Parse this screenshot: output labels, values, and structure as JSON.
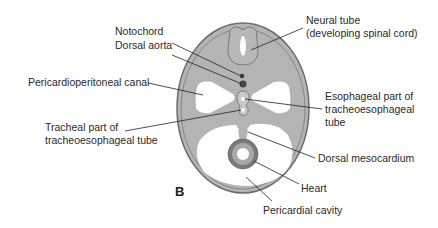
{
  "figure": {
    "panel_letter": "B",
    "colors": {
      "tissue": "#b4b4b4",
      "outline": "#6a6a6a",
      "cavity": "#ffffff",
      "heart_outer": "#7a7a7a",
      "heart_inner": "#a8a8a8",
      "leader": "#222222"
    }
  },
  "labels": {
    "notochord": "Notochord",
    "dorsal_aorta": "Dorsal aorta",
    "pericardioperitoneal_canal": "Pericardioperitoneal canal",
    "tracheal_part_line1": "Tracheal part of",
    "tracheal_part_line2": "tracheoesophageal tube",
    "neural_tube_line1": "Neural tube",
    "neural_tube_line2": "(developing spinal cord)",
    "esophageal_part_line1": "Esophageal part of",
    "esophageal_part_line2": "tracheoesophageal",
    "esophageal_part_line3": "tube",
    "dorsal_mesocardium": "Dorsal mesocardium",
    "heart": "Heart",
    "pericardial_cavity": "Pericardial cavity"
  }
}
